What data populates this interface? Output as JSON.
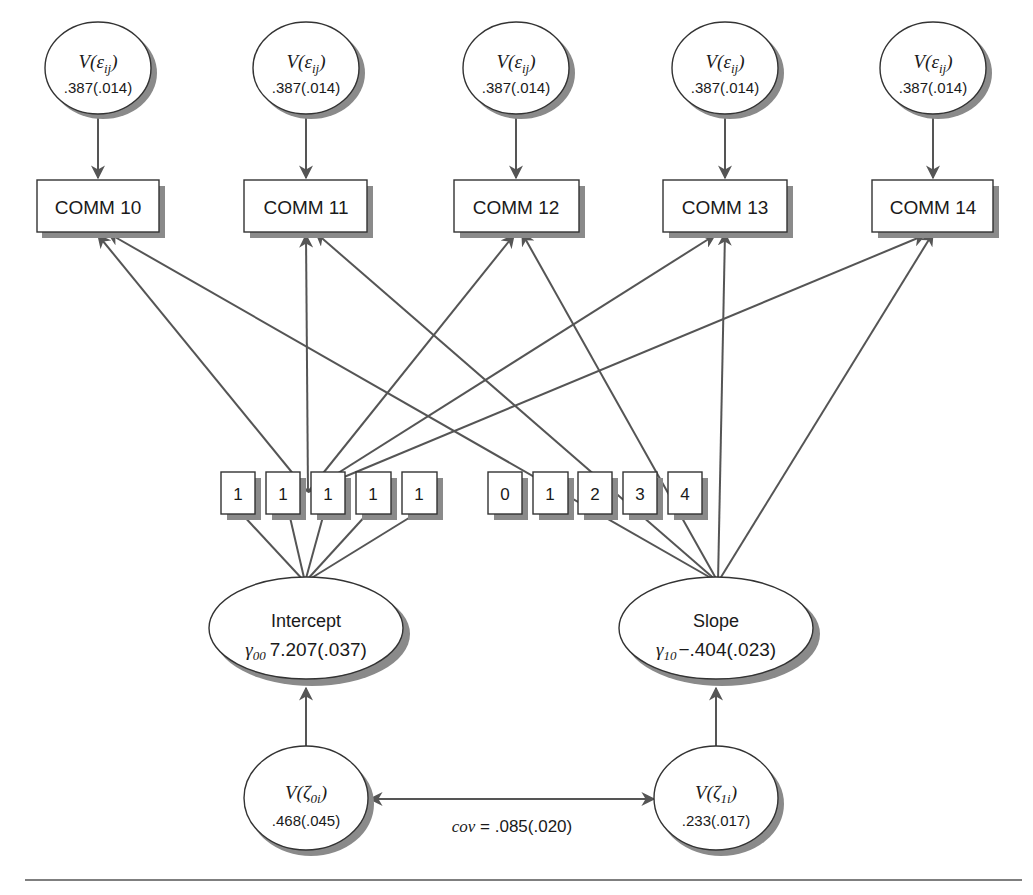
{
  "diagram": {
    "type": "latent growth curve path diagram",
    "residuals": [
      {
        "label_prefix": "V(",
        "symbol": "ε",
        "subscript": "ij",
        "label_suffix": ")",
        "value": ".387(.014)"
      },
      {
        "label_prefix": "V(",
        "symbol": "ε",
        "subscript": "ij",
        "label_suffix": ")",
        "value": ".387(.014)"
      },
      {
        "label_prefix": "V(",
        "symbol": "ε",
        "subscript": "ij",
        "label_suffix": ")",
        "value": ".387(.014)"
      },
      {
        "label_prefix": "V(",
        "symbol": "ε",
        "subscript": "ij",
        "label_suffix": ")",
        "value": ".387(.014)"
      },
      {
        "label_prefix": "V(",
        "symbol": "ε",
        "subscript": "ij",
        "label_suffix": ")",
        "value": ".387(.014)"
      }
    ],
    "observed": [
      {
        "label": "COMM 10"
      },
      {
        "label": "COMM 11"
      },
      {
        "label": "COMM 12"
      },
      {
        "label": "COMM 13"
      },
      {
        "label": "COMM 14"
      }
    ],
    "intercept_loadings": [
      "1",
      "1",
      "1",
      "1",
      "1"
    ],
    "slope_loadings": [
      "0",
      "1",
      "2",
      "3",
      "4"
    ],
    "intercept": {
      "label": "Intercept",
      "symbol": "γ",
      "subscript": "00",
      "value": "7.207(.037)"
    },
    "slope": {
      "label": "Slope",
      "symbol": "γ",
      "subscript": "10",
      "value": "−.404(.023)"
    },
    "intercept_variance": {
      "label_prefix": "V(",
      "symbol": "ζ",
      "subscript": "0i",
      "label_suffix": ")",
      "value": ".468(.045)"
    },
    "slope_variance": {
      "label_prefix": "V(",
      "symbol": "ζ",
      "subscript": "1i",
      "label_suffix": ")",
      "value": ".233(.017)"
    },
    "covariance": {
      "label": "cov",
      "equals": " = ",
      "value": ".085(.020)"
    }
  }
}
